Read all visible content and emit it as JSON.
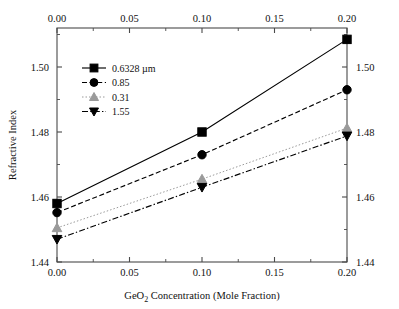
{
  "chart_data": {
    "type": "line",
    "title": "",
    "subtitle": "",
    "xlabel": "GeO2 Concentration (Mole Fraction)",
    "xlabel_parts": {
      "pre": "GeO",
      "sub": "2",
      "post": " Concentration (Mole Fraction)"
    },
    "ylabel": "Refractive Index",
    "xlim": [
      0.0,
      0.2
    ],
    "ylim": [
      1.44,
      1.512
    ],
    "x_ticks": [
      0.0,
      0.05,
      0.1,
      0.15,
      0.2
    ],
    "x_tick_labels": [
      "0.00",
      "0.05",
      "0.10",
      "0.15",
      "0.20"
    ],
    "x_minor_ticks": [
      0.025,
      0.075,
      0.125,
      0.175
    ],
    "y_ticks": [
      1.44,
      1.46,
      1.48,
      1.5
    ],
    "y_tick_labels": [
      "1.44",
      "1.46",
      "1.48",
      "1.50"
    ],
    "y_minor_ticks": [
      1.45,
      1.47,
      1.49,
      1.51
    ],
    "grid": false,
    "axes_mirrored": true,
    "top_axis_labeled": true,
    "right_axis_labeled": true,
    "legend_position": "upper-left-inside",
    "x": [
      0.0,
      0.1,
      0.2
    ],
    "series": [
      {
        "name": "0.6328 µm",
        "label": "0.6328 µm",
        "marker": "square",
        "linestyle": "solid",
        "color": "#000000",
        "values": [
          1.458,
          1.48,
          1.5085
        ]
      },
      {
        "name": "0.85",
        "label": "0.85",
        "marker": "circle",
        "linestyle": "dashed",
        "color": "#000000",
        "values": [
          1.4552,
          1.473,
          1.493
        ]
      },
      {
        "name": "0.31",
        "label": "0.31",
        "marker": "triangle-up",
        "linestyle": "dotted",
        "color": "#9a9a9a",
        "values": [
          1.4505,
          1.4655,
          1.4812
        ]
      },
      {
        "name": "1.55",
        "label": "1.55",
        "marker": "triangle-down",
        "linestyle": "dashdot",
        "color": "#000000",
        "values": [
          1.447,
          1.463,
          1.4788
        ]
      }
    ]
  },
  "figure": {
    "background_color": "#ffffff",
    "axis_color": "#4a4a4a",
    "text_color": "#111111"
  }
}
